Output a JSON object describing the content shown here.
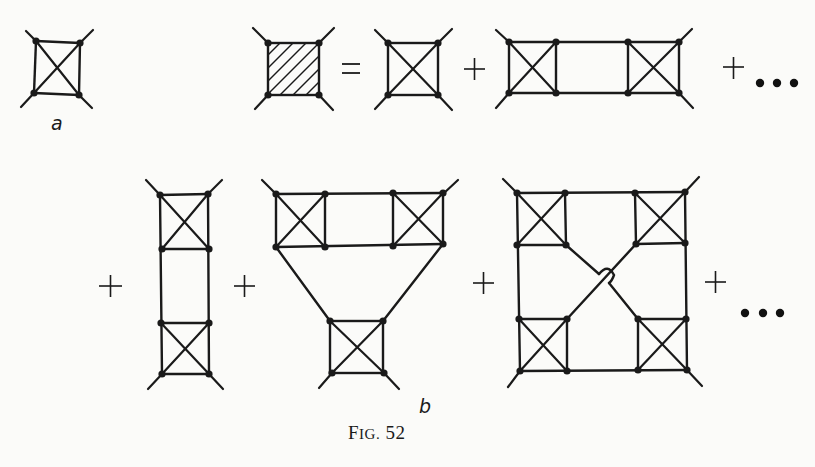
{
  "figure": {
    "caption_prefix": "F",
    "caption_smallcaps": "IG.",
    "caption_number": "52",
    "caption": "Fig. 52",
    "panels": [
      {
        "id": "a",
        "label": "a",
        "description": "Single four-point vertex: square with both diagonals and four external legs"
      },
      {
        "id": "b",
        "label": "b",
        "description": "Expansion of the full (hatched) four-point vertex as a sum of ladder-type diagrams built from elementary crossed-square vertices"
      }
    ]
  },
  "equation_top": {
    "lhs": "hatched-square-vertex",
    "equals": "=",
    "terms": [
      "single-crossed-square",
      "two-crossed-squares-horizontal-ladder"
    ],
    "plus": "+",
    "ellipsis": "• • •"
  },
  "equation_bottom": {
    "terms": [
      "two-crossed-squares-vertical-ladder",
      "three-crossed-squares-triangle",
      "four-crossed-squares-with-crossing-lines"
    ],
    "plus": "+",
    "ellipsis": "• • •"
  },
  "colors": {
    "ink": "#1a1a1a",
    "paper": "#fbfbf9"
  }
}
